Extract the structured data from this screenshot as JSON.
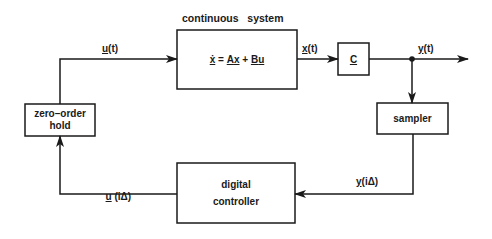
{
  "diagram": {
    "title": "continuous   system",
    "blocks": {
      "plant": {
        "equation_parts": [
          "ẋ",
          " = ",
          "A",
          "x",
          " + ",
          "B",
          "u"
        ]
      },
      "output_matrix": {
        "label": "C"
      },
      "sampler": {
        "label": "sampler"
      },
      "zoh": {
        "line1": "zero–order",
        "line2": "hold"
      },
      "controller": {
        "line1": "digital",
        "line2": "controller"
      }
    },
    "signals": {
      "u_t": {
        "sym": "u",
        "arg": "(t)"
      },
      "x_t": {
        "sym": "x",
        "arg": "(t)"
      },
      "y_t": {
        "sym": "y",
        "arg": "(t)"
      },
      "y_i": {
        "sym": "y",
        "arg": "(iΔ)"
      },
      "u_i": {
        "sym": "u",
        "arg": " (iΔ)"
      }
    },
    "colors": {
      "stroke": "#1a1a1a",
      "background": "#ffffff"
    }
  }
}
